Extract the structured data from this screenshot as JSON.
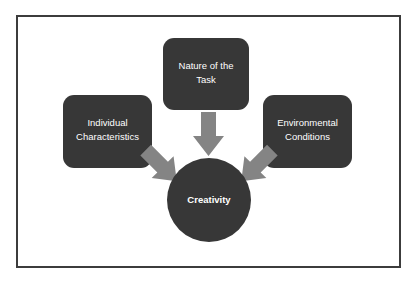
{
  "figure": {
    "background_color": "#ffffff",
    "frame_color": "#3c3c3c",
    "node_fill": "#373737",
    "arrow_fill": "#848484",
    "label_color": "#ffffff"
  },
  "nodes": [
    {
      "id": "nature-of-the-task",
      "lines": [
        "Nature of the",
        "Task"
      ],
      "shape": "rounded-rect",
      "x": 163,
      "y": 38,
      "w": 86,
      "h": 72
    },
    {
      "id": "individual-characteristics",
      "lines": [
        "Individual",
        "Characteristics"
      ],
      "shape": "rounded-rect",
      "x": 63,
      "y": 95,
      "w": 89,
      "h": 73
    },
    {
      "id": "environmental-conditions",
      "lines": [
        "Environmental",
        "Conditions"
      ],
      "shape": "rounded-rect",
      "x": 263,
      "y": 95,
      "w": 89,
      "h": 73
    }
  ],
  "hub": {
    "id": "creativity",
    "label": "Creativity",
    "shape": "circle",
    "cx": 209,
    "cy": 200,
    "r": 42
  },
  "arrows": [
    {
      "id": "arrow-task-to-creativity",
      "direction": "down",
      "from": "nature-of-the-task",
      "to": "creativity"
    },
    {
      "id": "arrow-individual-to-creativity",
      "direction": "down-right",
      "from": "individual-characteristics",
      "to": "creativity"
    },
    {
      "id": "arrow-environmental-to-creativity",
      "direction": "down-left",
      "from": "environmental-conditions",
      "to": "creativity"
    }
  ]
}
